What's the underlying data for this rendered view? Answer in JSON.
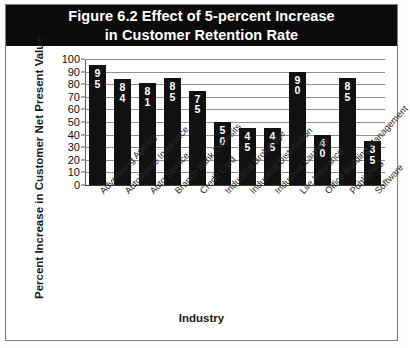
{
  "figure": {
    "title_line1": "Figure 6.2 Effect of 5-percent Increase",
    "title_line2": "in Customer Retention  Rate",
    "banner_color": "#0b0b0b",
    "bar_color": "#111111",
    "grid_color": "#8f8f8f"
  },
  "chart_data": {
    "type": "bar",
    "title": "Figure 6.2 Effect of 5-percent Increase in Customer Retention  Rate",
    "xlabel": "Industry",
    "ylabel": "Percent Increase in Customer Net Present Value",
    "ylim": [
      0,
      100
    ],
    "yticks": [
      0,
      10,
      20,
      30,
      40,
      50,
      60,
      70,
      80,
      90,
      100
    ],
    "grid": true,
    "legend": false,
    "categories": [
      "Advertising Agency",
      "Auto/home Insurance",
      "Auto Service",
      "Branch Bank Deposits",
      "Credit Card",
      "Industrial Brokerage",
      "Industrial Distribution",
      "Industrial Laundry",
      "Life Insurance",
      "Office Building Management",
      "Publishing",
      "Software"
    ],
    "values": [
      95,
      84,
      81,
      85,
      75,
      50,
      45,
      45,
      90,
      40,
      85,
      35
    ]
  }
}
